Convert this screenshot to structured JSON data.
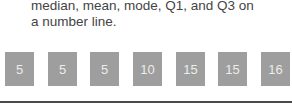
{
  "instructions": {
    "line1": "median, mean, mode, Q1, and Q3 on",
    "line2": "a number line."
  },
  "tiles": [
    {
      "value": "5"
    },
    {
      "value": "5"
    },
    {
      "value": "5"
    },
    {
      "value": "10"
    },
    {
      "value": "15"
    },
    {
      "value": "15"
    },
    {
      "value": "16"
    }
  ],
  "colors": {
    "tile_bg": "#9e9e9e",
    "tile_text": "#ececec",
    "line": "#4a4a4a",
    "text": "#444444"
  }
}
